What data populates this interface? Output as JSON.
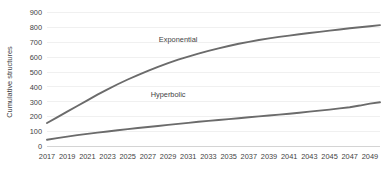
{
  "chart_data": {
    "type": "line",
    "title": "",
    "xlabel": "",
    "ylabel": "Cumulative structures",
    "ylim": [
      0,
      900
    ],
    "xlim": [
      2017,
      2050
    ],
    "grid": true,
    "legend_position": "inline-annotations",
    "ytick_labels": [
      "0",
      "100",
      "200",
      "300",
      "400",
      "500",
      "600",
      "700",
      "800",
      "900"
    ],
    "ytick_values": [
      0,
      100,
      200,
      300,
      400,
      500,
      600,
      700,
      800,
      900
    ],
    "xtick_labels": [
      "2017",
      "2019",
      "2021",
      "2023",
      "2025",
      "2027",
      "2029",
      "2031",
      "2033",
      "2035",
      "2037",
      "2039",
      "2041",
      "2043",
      "2045",
      "2047",
      "2049"
    ],
    "xtick_values": [
      2017,
      2019,
      2021,
      2023,
      2025,
      2027,
      2029,
      2031,
      2033,
      2035,
      2037,
      2039,
      2041,
      2043,
      2045,
      2047,
      2049
    ],
    "x": [
      2017,
      2018,
      2019,
      2020,
      2021,
      2022,
      2023,
      2024,
      2025,
      2026,
      2027,
      2028,
      2029,
      2030,
      2031,
      2032,
      2033,
      2034,
      2035,
      2036,
      2037,
      2038,
      2039,
      2040,
      2041,
      2042,
      2043,
      2044,
      2045,
      2046,
      2047,
      2048,
      2049,
      2050
    ],
    "series": [
      {
        "name": "Exponential",
        "color": "#6b6b6b",
        "values": [
          158,
          196,
          234,
          272,
          310,
          348,
          384,
          418,
          450,
          480,
          508,
          535,
          560,
          583,
          604,
          624,
          642,
          659,
          675,
          690,
          703,
          715,
          726,
          736,
          745,
          754,
          762,
          770,
          778,
          786,
          794,
          801,
          808,
          815
        ],
        "label_x": 2030,
        "label_y": 700
      },
      {
        "name": "Hyperbolic",
        "color": "#6b6b6b",
        "values": [
          45,
          56,
          66,
          76,
          85,
          93,
          101,
          109,
          117,
          124,
          131,
          138,
          145,
          152,
          159,
          166,
          172,
          178,
          184,
          190,
          196,
          202,
          208,
          214,
          220,
          227,
          234,
          241,
          248,
          256,
          264,
          275,
          288,
          297
        ],
        "label_x": 2029,
        "label_y": 330
      }
    ],
    "annotations": [
      {
        "text": "Exponential",
        "series": "Exponential"
      },
      {
        "text": "Hyperbolic",
        "series": "Hyperbolic"
      }
    ],
    "colors": {
      "series_line": "#6b6b6b",
      "gridline": "#e9e9e9",
      "axis": "#c9c9c9",
      "text": "#3f3f3f",
      "background": "#ffffff"
    }
  }
}
